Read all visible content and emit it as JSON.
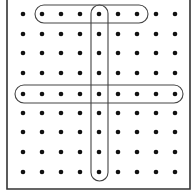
{
  "diagram": {
    "title": "",
    "grid": {
      "rows": 9,
      "cols": 9,
      "x_positions": [
        23,
        42,
        61,
        80,
        99,
        118,
        137,
        156,
        175
      ],
      "y_positions": [
        14,
        34,
        53,
        73,
        94,
        113,
        132,
        152,
        172
      ],
      "dot_color": "#111111",
      "dot_radius": 2.3
    },
    "frame": {
      "color": "#333333",
      "left": 7,
      "right": 190,
      "bottom": 189,
      "top_open": true
    },
    "groups": [
      {
        "id": "top-row-group",
        "orientation": "horizontal",
        "row": 1,
        "col_start": 2,
        "col_end": 7,
        "x": 35,
        "y": 5,
        "width": 113,
        "height": 18
      },
      {
        "id": "middle-row-group",
        "orientation": "horizontal",
        "row": 5,
        "col_start": 1,
        "col_end": 9,
        "x": 15,
        "y": 85,
        "width": 168,
        "height": 18
      },
      {
        "id": "center-column-group",
        "orientation": "vertical",
        "col": 5,
        "row_start": 1,
        "row_end": 9,
        "x": 91,
        "y": 5,
        "width": 17,
        "height": 176
      }
    ],
    "outline_color": "#444444"
  }
}
